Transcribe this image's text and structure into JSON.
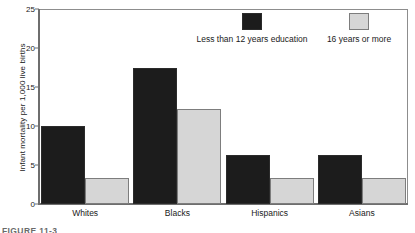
{
  "chart_data": {
    "type": "bar",
    "title": "",
    "xlabel": "",
    "ylabel": "Infant mortality per 1,000 live births",
    "ylim": [
      0,
      25
    ],
    "yticks": [
      0,
      5,
      10,
      15,
      20,
      25
    ],
    "grid": false,
    "legend_position": "top-right-inside",
    "categories": [
      "Whites",
      "Blacks",
      "Hispanics",
      "Asians"
    ],
    "series": [
      {
        "name": "Less than 12 years education",
        "color": "#1c1c1c",
        "values": [
          10.0,
          17.5,
          6.3,
          6.3
        ]
      },
      {
        "name": "16 years or more",
        "color": "#d6d6d6",
        "values": [
          3.3,
          12.2,
          3.3,
          3.3
        ]
      }
    ]
  },
  "axis": {
    "y_title": "Infant mortality per 1,000 live births",
    "tick_labels": [
      "0",
      "5",
      "10",
      "15",
      "20",
      "25"
    ]
  },
  "legend": {
    "entries": [
      {
        "label": "Less than 12 years education"
      },
      {
        "label": "16 years or more"
      }
    ]
  },
  "caption": {
    "text": "FIGURE 11-3"
  }
}
